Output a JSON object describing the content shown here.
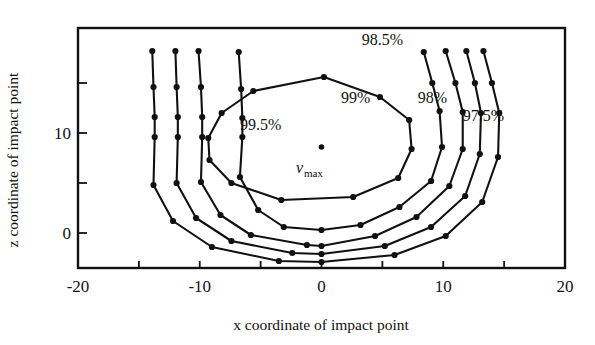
{
  "chart_data": {
    "type": "line",
    "title": "",
    "xlabel": "x coordinate of impact point",
    "ylabel": "z coordinate of impact point",
    "xlim": [
      -20,
      20
    ],
    "ylim": [
      -3.5,
      20.5
    ],
    "xticks": [
      -20,
      -15,
      -10,
      -5,
      0,
      5,
      10,
      15,
      20
    ],
    "xtick_labels": [
      "-20",
      "",
      "-10",
      "",
      "0",
      "",
      "10",
      "",
      "20"
    ],
    "yticks": [
      0,
      5,
      10,
      15
    ],
    "ytick_labels": [
      "0",
      "",
      "10",
      ""
    ],
    "grid": false,
    "legend": "none",
    "marker": "filled-circle",
    "annotations": [
      {
        "name": "vmax-point",
        "text": "",
        "x": 0.0,
        "z": 8.6
      },
      {
        "name": "vmax-label",
        "text": "v",
        "sub": "max",
        "x": -2.1,
        "z": 6.0
      }
    ],
    "series": [
      {
        "name": "99.5%",
        "label": "99.5%",
        "label_x": -5.0,
        "label_z": 10.3,
        "closed": true,
        "points": [
          {
            "x": -9.3,
            "z": 9.5
          },
          {
            "x": -8.2,
            "z": 12.0
          },
          {
            "x": -5.6,
            "z": 14.2
          },
          {
            "x": 0.2,
            "z": 15.6
          },
          {
            "x": 4.8,
            "z": 13.6
          },
          {
            "x": 7.2,
            "z": 11.3
          },
          {
            "x": 7.4,
            "z": 8.4
          },
          {
            "x": 6.3,
            "z": 5.5
          },
          {
            "x": 2.6,
            "z": 3.6
          },
          {
            "x": -3.3,
            "z": 3.3
          },
          {
            "x": -7.4,
            "z": 5.0
          },
          {
            "x": -9.2,
            "z": 7.3
          }
        ]
      },
      {
        "name": "99%",
        "label": "99%",
        "label_x": 2.8,
        "label_z": 13.0,
        "closed": false,
        "points": [
          {
            "x": -6.8,
            "z": 18.1
          },
          {
            "x": -6.6,
            "z": 14.4
          },
          {
            "x": -6.5,
            "z": 11.5
          },
          {
            "x": -6.5,
            "z": 9.6
          },
          {
            "x": -6.7,
            "z": 5.6
          },
          {
            "x": -5.2,
            "z": 2.3
          },
          {
            "x": -3.1,
            "z": 0.6
          },
          {
            "x": 0.0,
            "z": 0.3
          },
          {
            "x": 3.2,
            "z": 0.8
          },
          {
            "x": 6.4,
            "z": 2.6
          },
          {
            "x": 9.0,
            "z": 5.2
          },
          {
            "x": 9.9,
            "z": 8.6
          },
          {
            "x": 9.7,
            "z": 12.2
          },
          {
            "x": 9.1,
            "z": 15.0
          },
          {
            "x": 8.4,
            "z": 18.1
          }
        ]
      },
      {
        "name": "98.5%",
        "label": "98.5%",
        "label_x": 5.0,
        "label_z": 18.8,
        "closed": false,
        "points": [
          {
            "x": -10.1,
            "z": 18.2
          },
          {
            "x": -9.9,
            "z": 14.6
          },
          {
            "x": -9.8,
            "z": 11.6
          },
          {
            "x": -9.8,
            "z": 9.6
          },
          {
            "x": -9.9,
            "z": 5.1
          },
          {
            "x": -8.3,
            "z": 1.8
          },
          {
            "x": -5.8,
            "z": -0.2
          },
          {
            "x": -1.2,
            "z": -1.2
          },
          {
            "x": 0.0,
            "z": -1.3
          },
          {
            "x": 4.4,
            "z": -0.3
          },
          {
            "x": 7.8,
            "z": 1.6
          },
          {
            "x": 10.5,
            "z": 4.7
          },
          {
            "x": 11.6,
            "z": 8.4
          },
          {
            "x": 11.6,
            "z": 12.1
          },
          {
            "x": 11.0,
            "z": 15.0
          },
          {
            "x": 10.2,
            "z": 18.2
          }
        ]
      },
      {
        "name": "98%",
        "label": "98%",
        "label_x": 9.1,
        "label_z": 13.0,
        "closed": false,
        "points": [
          {
            "x": -12.0,
            "z": 18.2
          },
          {
            "x": -11.9,
            "z": 14.6
          },
          {
            "x": -11.8,
            "z": 11.6
          },
          {
            "x": -11.8,
            "z": 9.6
          },
          {
            "x": -11.9,
            "z": 5.0
          },
          {
            "x": -10.3,
            "z": 1.5
          },
          {
            "x": -7.4,
            "z": -0.8
          },
          {
            "x": -2.4,
            "z": -2.0
          },
          {
            "x": 0.0,
            "z": -2.1
          },
          {
            "x": 5.2,
            "z": -1.3
          },
          {
            "x": 9.0,
            "z": 0.6
          },
          {
            "x": 11.8,
            "z": 3.7
          },
          {
            "x": 13.0,
            "z": 7.9
          },
          {
            "x": 13.1,
            "z": 12.0
          },
          {
            "x": 12.6,
            "z": 15.0
          },
          {
            "x": 11.9,
            "z": 18.2
          }
        ]
      },
      {
        "name": "97.5%",
        "label": "97.5%",
        "label_x": 13.3,
        "label_z": 11.2,
        "closed": false,
        "points": [
          {
            "x": -13.9,
            "z": 18.2
          },
          {
            "x": -13.8,
            "z": 14.6
          },
          {
            "x": -13.7,
            "z": 11.6
          },
          {
            "x": -13.7,
            "z": 9.6
          },
          {
            "x": -13.8,
            "z": 4.8
          },
          {
            "x": -12.2,
            "z": 1.2
          },
          {
            "x": -9.0,
            "z": -1.4
          },
          {
            "x": -3.5,
            "z": -2.8
          },
          {
            "x": 0.0,
            "z": -2.9
          },
          {
            "x": 6.0,
            "z": -2.2
          },
          {
            "x": 10.2,
            "z": -0.3
          },
          {
            "x": 13.2,
            "z": 3.1
          },
          {
            "x": 14.5,
            "z": 7.6
          },
          {
            "x": 14.6,
            "z": 12.0
          },
          {
            "x": 14.0,
            "z": 15.0
          },
          {
            "x": 13.3,
            "z": 18.2
          }
        ]
      }
    ]
  },
  "axes": {
    "x_title": "x coordinate of impact point",
    "z_title": "z coordinate of impact point"
  }
}
